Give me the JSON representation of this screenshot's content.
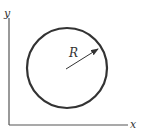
{
  "diagram": {
    "axes": {
      "x_label": "x",
      "y_label": "y",
      "color": "#555555"
    },
    "circle": {
      "cx": 67,
      "cy": 68,
      "r": 40,
      "stroke": "#333333",
      "stroke_width": 2.2
    },
    "radius_arrow": {
      "label": "R",
      "from": [
        66,
        69
      ],
      "to": [
        98,
        49
      ]
    }
  }
}
